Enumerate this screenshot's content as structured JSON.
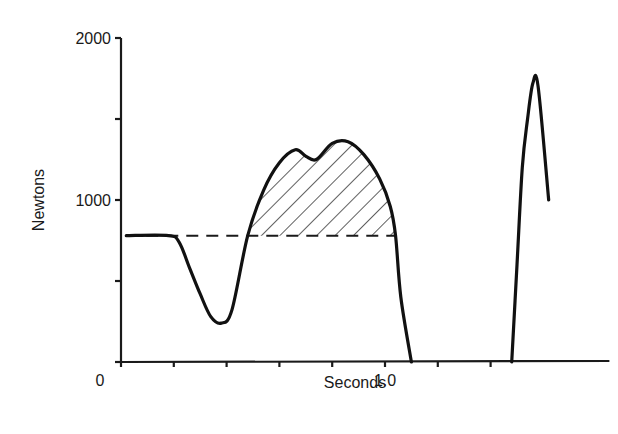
{
  "chart_data": {
    "type": "line",
    "title": "",
    "xlabel": "Seconds",
    "ylabel": "Newtons",
    "xlim": [
      0,
      1.85
    ],
    "ylim": [
      0,
      2000
    ],
    "grid": false,
    "legend": null,
    "x_ticks": [
      0,
      0.2,
      0.4,
      0.6,
      0.8,
      1.0,
      1.2,
      1.4
    ],
    "x_tick_labels": [
      {
        "value": 0,
        "label": "0"
      },
      {
        "value": 1.0,
        "label": "1.0"
      }
    ],
    "y_ticks": [
      0,
      500,
      1000,
      1500,
      2000
    ],
    "y_tick_labels": [
      {
        "value": 1000,
        "label": "1000"
      },
      {
        "value": 2000,
        "label": "2000"
      }
    ],
    "reference_line": {
      "type": "dashed",
      "y": 780,
      "x_start": 0.02,
      "x_end": 1.04,
      "label": "body weight"
    },
    "shaded_region": {
      "pattern": "diagonal-hatch",
      "description": "area between force curve and body-weight line",
      "x_start": 0.48,
      "x_end": 1.04
    },
    "series": [
      {
        "name": "jump force",
        "x": [
          0.02,
          0.18,
          0.22,
          0.26,
          0.3,
          0.34,
          0.38,
          0.42,
          0.48,
          0.54,
          0.6,
          0.66,
          0.7,
          0.74,
          0.8,
          0.86,
          0.92,
          0.98,
          1.02,
          1.04,
          1.06,
          1.1
        ],
        "y": [
          780,
          780,
          740,
          580,
          420,
          280,
          240,
          320,
          780,
          1060,
          1230,
          1310,
          1270,
          1250,
          1350,
          1360,
          1280,
          1130,
          960,
          780,
          400,
          0
        ]
      },
      {
        "name": "landing force",
        "x": [
          1.48,
          1.5,
          1.52,
          1.54,
          1.56,
          1.58,
          1.62
        ],
        "y": [
          0,
          600,
          1200,
          1500,
          1720,
          1700,
          1000
        ]
      }
    ]
  }
}
